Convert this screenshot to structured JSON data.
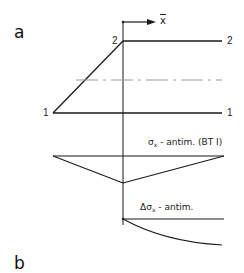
{
  "panels": {
    "a": {
      "label": "a"
    },
    "b": {
      "label": "b"
    }
  },
  "axis": {
    "label": "x"
  },
  "nodes": {
    "top_left": "2",
    "top_right": "2",
    "bottom_left": "1",
    "bottom_right": "1"
  },
  "curves": {
    "sigma": {
      "symbol": "σ",
      "subscript": "x",
      "text": " - antim. (BT I)"
    },
    "delta_sigma": {
      "symbol": "Δσ",
      "subscript": "x",
      "text": " - antim."
    }
  },
  "colors": {
    "line": "#1a1a1a",
    "dashed": "#9a9a9a"
  }
}
